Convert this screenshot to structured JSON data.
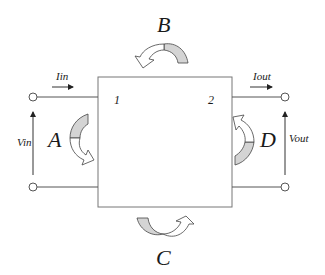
{
  "diagram": {
    "ports": {
      "port1_label": "1",
      "port2_label": "2"
    },
    "currents": {
      "input_label": "Iin",
      "output_label": "Iout"
    },
    "voltages": {
      "input_label": "Vin",
      "output_label": "Vout"
    },
    "parameters": {
      "A": "A",
      "B": "B",
      "C": "C",
      "D": "D"
    },
    "colors": {
      "arrow_fill": "#d4d4d4",
      "line": "#555555",
      "text": "#1a1a1a"
    }
  }
}
